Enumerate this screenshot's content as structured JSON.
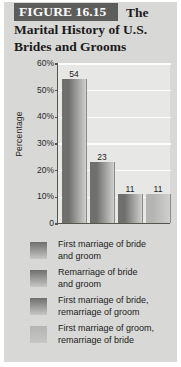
{
  "figure": {
    "number_label": "FIGURE 16.15",
    "title_line_1": "The",
    "title_line_2": "Marital History of U.S.",
    "title_line_3": "Brides and Grooms",
    "band_color": "#5d5d5b",
    "panel_background": "#d8d8d6"
  },
  "chart_data": {
    "type": "bar",
    "title": "FIGURE 16.15 The Marital History of U.S. Brides and Grooms",
    "xlabel": "",
    "ylabel": "Percentage",
    "ylim": [
      0,
      60
    ],
    "ytick_labels": [
      "60%",
      "50%",
      "40%",
      "30%",
      "20%",
      "10%",
      "0"
    ],
    "ytick_values": [
      60,
      50,
      40,
      30,
      20,
      10,
      0
    ],
    "grid": true,
    "legend_position": "below",
    "categories": [
      "First marriage of bride and groom",
      "Remarriage of bride and groom",
      "First marriage of bride, remarriage of groom",
      "First marriage of groom, remarriage of bride"
    ],
    "values": [
      54,
      23,
      11,
      11
    ],
    "data_labels": [
      "54",
      "23",
      "11",
      "11"
    ],
    "bar_colors": [
      "#6f6f6d",
      "#6f6f6d",
      "#6f6f6d",
      "#b4b4b2"
    ],
    "plot_background": "#e7e7e5"
  },
  "legend": {
    "items": [
      {
        "label_line_1": "First marriage of bride",
        "label_line_2": "and groom"
      },
      {
        "label_line_1": "Remarriage of bride",
        "label_line_2": "and groom"
      },
      {
        "label_line_1": "First marriage of bride,",
        "label_line_2": "remarriage of groom"
      },
      {
        "label_line_1": "First marriage of groom,",
        "label_line_2": "remarriage of bride"
      }
    ]
  }
}
